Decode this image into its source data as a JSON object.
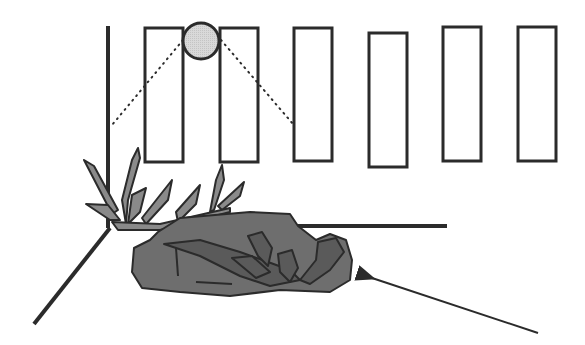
{
  "diagram": {
    "colors": {
      "stroke": "#2b2b2b",
      "background": "#ffffff",
      "sun_fill": "#d9d9d9",
      "leaf_fill": "#8a8a8a",
      "clump_fill": "#6e6e6e",
      "clump_leaf_fill": "#5a5a5a"
    },
    "panels": [
      {
        "x": 145,
        "y": 28,
        "w": 38,
        "h": 134
      },
      {
        "x": 220,
        "y": 28,
        "w": 38,
        "h": 134
      },
      {
        "x": 294,
        "y": 28,
        "w": 38,
        "h": 133
      },
      {
        "x": 369,
        "y": 33,
        "w": 38,
        "h": 134
      },
      {
        "x": 443,
        "y": 27,
        "w": 38,
        "h": 134
      },
      {
        "x": 518,
        "y": 27,
        "w": 38,
        "h": 134
      }
    ],
    "sun": {
      "cx": 201,
      "cy": 41,
      "r": 18
    },
    "light_rays": [
      {
        "x1": 183,
        "y1": 40,
        "x2": 112,
        "y2": 125
      },
      {
        "x1": 221,
        "y1": 40,
        "x2": 293,
        "y2": 124
      }
    ],
    "axes": {
      "vertical": {
        "x1": 108,
        "y1": 26,
        "x2": 108,
        "y2": 228
      },
      "horizontal": {
        "x1": 292,
        "y1": 226,
        "x2": 447,
        "y2": 226
      },
      "diagonal": {
        "x1": 110,
        "y1": 228,
        "x2": 34,
        "y2": 324
      }
    },
    "pointer_arrow": {
      "x1": 538,
      "y1": 333,
      "x2": 372,
      "y2": 278
    }
  }
}
